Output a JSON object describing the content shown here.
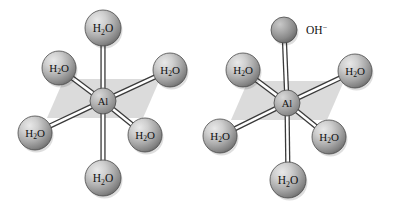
{
  "figure": {
    "background_color": "#ffffff",
    "width": 395,
    "height": 206
  },
  "palette": {
    "sphere_light": "#d6d6d6",
    "sphere_mid": "#a8a8a8",
    "sphere_dark": "#6f6f6f",
    "sphere_edge": "#4a4a4a",
    "plane_fill": "#d9d9d9",
    "bond_outline": "#3a3a3a",
    "bond_fill": "#ffffff",
    "label_color": "#111111"
  },
  "molecules": [
    {
      "id": "hexaaquaaluminium",
      "name": "Al(H2O)6",
      "center_label": "Al",
      "center": {
        "x": 103,
        "y": 101,
        "r": 13
      },
      "plane": {
        "points": "47,118 64,79 160,79 143,118"
      },
      "ligands": [
        {
          "position": "axial-top",
          "label": "H",
          "sub": "2",
          "label2": "O",
          "charge": "",
          "x": 103,
          "y": 28,
          "r": 18,
          "label_inside": true
        },
        {
          "position": "equatorial-upper-left",
          "label": "H",
          "sub": "2",
          "label2": "O",
          "charge": "",
          "x": 59,
          "y": 68,
          "r": 17,
          "label_inside": true
        },
        {
          "position": "equatorial-upper-right",
          "label": "H",
          "sub": "2",
          "label2": "O",
          "charge": "",
          "x": 170,
          "y": 70,
          "r": 17,
          "label_inside": true
        },
        {
          "position": "equatorial-lower-left",
          "label": "H",
          "sub": "2",
          "label2": "O",
          "charge": "",
          "x": 35,
          "y": 133,
          "r": 17,
          "label_inside": true
        },
        {
          "position": "equatorial-lower-right",
          "label": "H",
          "sub": "2",
          "label2": "O",
          "charge": "",
          "x": 145,
          "y": 135,
          "r": 17,
          "label_inside": true
        },
        {
          "position": "axial-bottom",
          "label": "H",
          "sub": "2",
          "label2": "O",
          "charge": "",
          "x": 103,
          "y": 178,
          "r": 18,
          "label_inside": true
        }
      ]
    },
    {
      "id": "pentaaquahydroxoaluminium",
      "name": "Al(H2O)5(OH)",
      "center_label": "Al",
      "center": {
        "x": 287,
        "y": 103,
        "r": 13
      },
      "plane": {
        "points": "231,120 248,81 344,81 327,120"
      },
      "ligands": [
        {
          "position": "axial-top",
          "label": "OH",
          "sub": "",
          "label2": "",
          "charge": "−",
          "x": 284,
          "y": 30,
          "r": 13,
          "label_inside": false,
          "label_offset_x": 22,
          "label_offset_y": 4
        },
        {
          "position": "equatorial-upper-left",
          "label": "H",
          "sub": "2",
          "label2": "O",
          "charge": "",
          "x": 243,
          "y": 70,
          "r": 17,
          "label_inside": true
        },
        {
          "position": "equatorial-upper-right",
          "label": "H",
          "sub": "2",
          "label2": "O",
          "charge": "",
          "x": 355,
          "y": 71,
          "r": 17,
          "label_inside": true
        },
        {
          "position": "equatorial-lower-left",
          "label": "H",
          "sub": "2",
          "label2": "O",
          "charge": "",
          "x": 220,
          "y": 136,
          "r": 17,
          "label_inside": true
        },
        {
          "position": "equatorial-lower-right",
          "label": "H",
          "sub": "2",
          "label2": "O",
          "charge": "",
          "x": 329,
          "y": 137,
          "r": 17,
          "label_inside": true
        },
        {
          "position": "axial-bottom",
          "label": "H",
          "sub": "2",
          "label2": "O",
          "charge": "",
          "x": 288,
          "y": 180,
          "r": 18,
          "label_inside": true
        }
      ]
    }
  ]
}
